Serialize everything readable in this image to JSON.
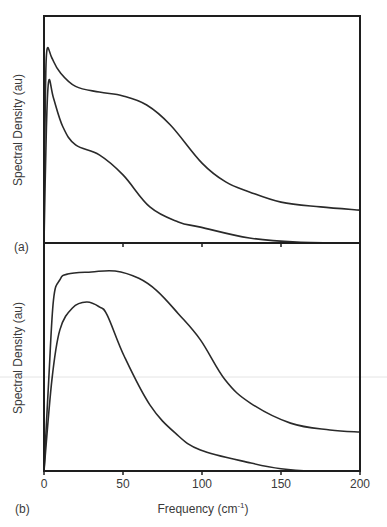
{
  "chart_data": [
    {
      "type": "line",
      "panel_label": "(a)",
      "title": "",
      "xlabel": "",
      "ylabel": "Spectral Density (au)",
      "xlim": [
        0,
        200
      ],
      "ylim": [
        0,
        1
      ],
      "x_ticks": [
        0,
        50,
        100,
        150,
        200
      ],
      "x_tick_labels_shown": false,
      "y_ticks": [],
      "grid": false,
      "legend": "none",
      "series": [
        {
          "name": "upper curve",
          "x": [
            0,
            1,
            2,
            5,
            10,
            20,
            35,
            50,
            65,
            80,
            100,
            115,
            130,
            150,
            175,
            200
          ],
          "y": [
            0.15,
            0.7,
            0.855,
            0.815,
            0.753,
            0.69,
            0.665,
            0.648,
            0.608,
            0.52,
            0.352,
            0.269,
            0.225,
            0.18,
            0.159,
            0.145
          ]
        },
        {
          "name": "lower curve",
          "x": [
            0,
            1.5,
            3,
            6,
            12,
            20,
            35,
            50,
            67,
            85,
            99,
            130,
            160,
            200
          ],
          "y": [
            0.0,
            0.5,
            0.714,
            0.639,
            0.511,
            0.432,
            0.388,
            0.3,
            0.159,
            0.093,
            0.07,
            0.022,
            0.004,
            0.0
          ]
        }
      ]
    },
    {
      "type": "line",
      "panel_label": "(b)",
      "title": "",
      "xlabel": "Frequency (cm",
      "xlabel_superscript": "-1",
      "xlabel_suffix": ")",
      "ylabel": "Spectral Density (au)",
      "xlim": [
        0,
        200
      ],
      "ylim": [
        0,
        1
      ],
      "x_ticks": [
        0,
        50,
        100,
        150,
        200
      ],
      "x_tick_labels": [
        "0",
        "50",
        "100",
        "150",
        "200"
      ],
      "y_ticks": [],
      "grid": false,
      "legend": "none",
      "series": [
        {
          "name": "upper curve",
          "x": [
            0,
            3,
            6,
            10,
            15,
            30,
            45,
            60,
            71.5,
            85,
            99,
            114.6,
            130.6,
            156,
            181,
            200
          ],
          "y": [
            0.0,
            0.4,
            0.75,
            0.838,
            0.864,
            0.873,
            0.877,
            0.845,
            0.79,
            0.69,
            0.575,
            0.4,
            0.298,
            0.21,
            0.18,
            0.171
          ]
        },
        {
          "name": "lower curve",
          "x": [
            0,
            5,
            10,
            18,
            27,
            35,
            40,
            51,
            67,
            83,
            99,
            131,
            150,
            170,
            200
          ],
          "y": [
            0.0,
            0.4,
            0.618,
            0.715,
            0.741,
            0.72,
            0.684,
            0.5,
            0.29,
            0.167,
            0.092,
            0.035,
            0.01,
            0.0,
            0.0
          ]
        }
      ]
    }
  ]
}
